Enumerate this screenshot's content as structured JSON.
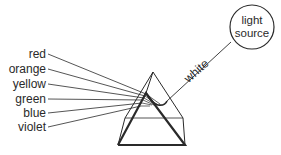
{
  "diagram": {
    "light_source": {
      "line1": "light",
      "line2": "source"
    },
    "incoming_beam_label": "white",
    "spectrum": [
      {
        "label": "red"
      },
      {
        "label": "orange"
      },
      {
        "label": "yellow"
      },
      {
        "label": "green"
      },
      {
        "label": "blue"
      },
      {
        "label": "violet"
      }
    ],
    "colors": {
      "line": "#2a2a2a",
      "background": "#ffffff"
    }
  }
}
